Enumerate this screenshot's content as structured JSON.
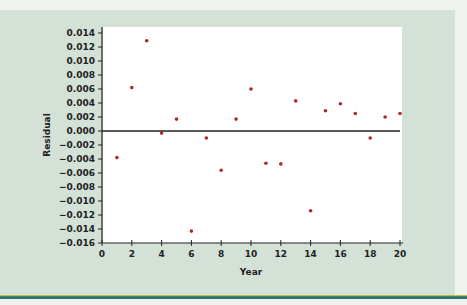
{
  "chart_data": {
    "type": "scatter",
    "title": "",
    "xlabel": "Year",
    "ylabel": "Residual",
    "xlim": [
      0,
      20
    ],
    "ylim": [
      -0.016,
      0.014
    ],
    "xticks": [
      0,
      2,
      4,
      6,
      8,
      10,
      12,
      14,
      16,
      18,
      20
    ],
    "yticks": [
      0.014,
      0.012,
      0.01,
      0.008,
      0.006,
      0.004,
      0.002,
      0.0,
      -0.002,
      -0.004,
      -0.006,
      -0.008,
      -0.01,
      -0.012,
      -0.014,
      -0.016
    ],
    "ytick_labels": [
      "0.014",
      "0.012",
      "0.010",
      "0.008",
      "0.006",
      "0.004",
      "0.002",
      "0.000",
      "-0.002",
      "-0.004",
      "-0.006",
      "-0.008",
      "-0.010",
      "-0.012",
      "-0.014",
      "-0.016"
    ],
    "reference_line": 0.0,
    "grid": false,
    "series": [
      {
        "name": "Residuals",
        "color": "#b0282c",
        "x": [
          1,
          2,
          3,
          4,
          5,
          6,
          7,
          8,
          9,
          10,
          11,
          12,
          13,
          14,
          15,
          16,
          17,
          18,
          19,
          20
        ],
        "y": [
          -0.0038,
          0.0062,
          0.0129,
          -0.0003,
          0.0017,
          -0.0143,
          -0.001,
          -0.0056,
          0.0017,
          0.006,
          -0.0046,
          -0.0047,
          0.0043,
          -0.0114,
          0.0029,
          0.0039,
          0.0025,
          -0.001,
          0.002,
          0.0025
        ]
      }
    ]
  },
  "colors": {
    "panel": "#d4e1d6",
    "plot_bg": "#ffffff",
    "point": "#b0282c",
    "axis": "#222222"
  }
}
